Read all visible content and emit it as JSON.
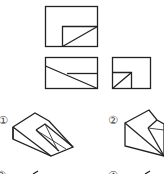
{
  "figure": {
    "views": {
      "front": {
        "name": "front-view"
      },
      "top": {
        "name": "top-view"
      },
      "side": {
        "name": "side-view"
      }
    },
    "options": [
      {
        "label": "①",
        "name": "option-1"
      },
      {
        "label": "②",
        "name": "option-2"
      },
      {
        "label": "③",
        "name": "option-3"
      },
      {
        "label": "④",
        "name": "option-4"
      }
    ],
    "stroke_color": "#222222",
    "background": "#ffffff"
  }
}
